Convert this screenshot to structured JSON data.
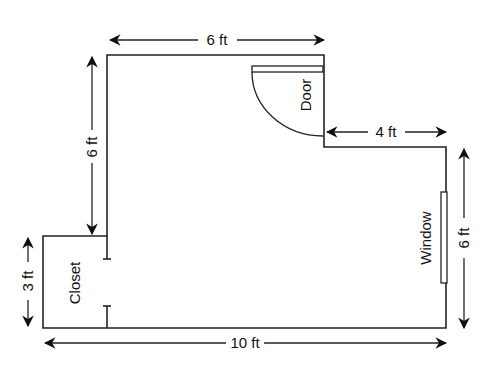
{
  "diagram": {
    "type": "floor-plan",
    "rooms": [
      {
        "name": "main-room"
      },
      {
        "name": "closet",
        "label": "Closet"
      }
    ],
    "features": {
      "door": {
        "label": "Door"
      },
      "window": {
        "label": "Window"
      }
    },
    "dimensions": {
      "top": "6 ft",
      "left_upper": "6 ft",
      "step": "4 ft",
      "right": "6 ft",
      "closet": "3 ft",
      "bottom": "10 ft"
    }
  }
}
